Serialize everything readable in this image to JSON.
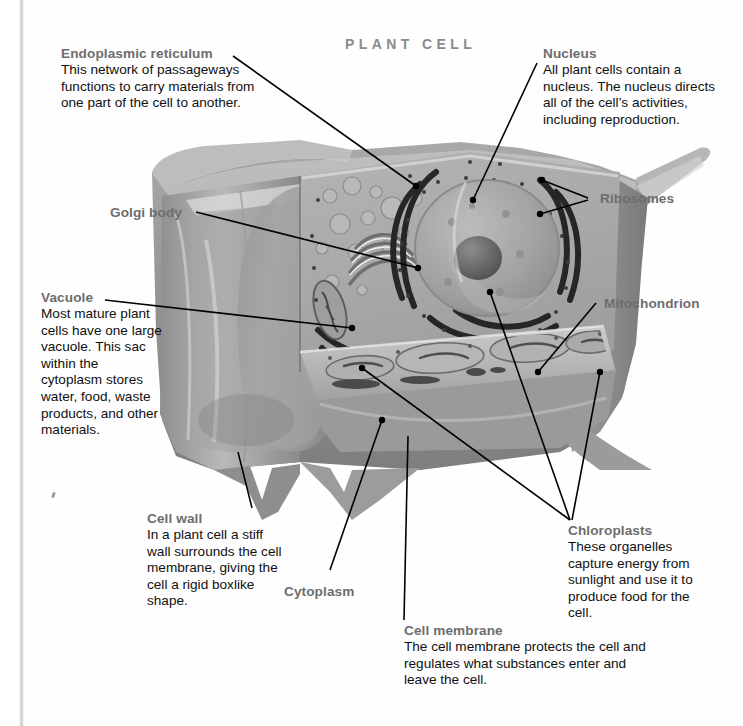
{
  "page": {
    "title": "PLANT CELL",
    "figure_type": "labeled biology diagram",
    "diagram_name": "plant-cell-cutaway-illustration"
  },
  "callouts": {
    "endoplasmic_reticulum": {
      "heading": "Endoplasmic reticulum",
      "body": "This network of passageways functions to carry materials from one part of the cell to another."
    },
    "nucleus": {
      "heading": "Nucleus",
      "body": "All plant cells contain a nucleus. The nucleus directs all of the cell’s activities, including reproduction."
    },
    "vacuole": {
      "heading": "Vacuole",
      "body": "Most mature plant cells have one large vacuole. This sac within the cytoplasm stores water, food, waste products, and other materials."
    },
    "cell_wall": {
      "heading": "Cell wall",
      "body": "In a plant cell a stiff wall surrounds the cell membrane, giving the cell a rigid boxlike shape."
    },
    "chloroplasts": {
      "heading": "Chloroplasts",
      "body": "These organelles capture energy from sunlight and use it to produce food for the cell."
    },
    "cell_membrane": {
      "heading": "Cell membrane",
      "body": "The cell membrane protects the cell and regulates what substances enter and leave the cell."
    }
  },
  "labels": {
    "golgi_body": "Golgi body",
    "ribosomes": "Ribosomes",
    "mitochondrion": "Mitochondrion",
    "cytoplasm": "Cytoplasm"
  },
  "colors": {
    "heading": "#6d6d6d",
    "body_text": "#101010",
    "title": "#8a8a8a",
    "leader_line": "#000000",
    "page_background": "#ffffff",
    "cell_wall_gray": "#8e8e8e",
    "vacuole_gray": "#9a9a9a",
    "cytoplasm_gray": "#a6a6a6",
    "nucleus_gray": "#9d9d9d",
    "organelle_dark": "#2b2b2b"
  }
}
